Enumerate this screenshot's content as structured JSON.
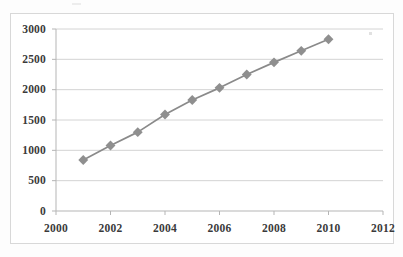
{
  "chart_data": {
    "type": "line",
    "title": "",
    "subtitle": "",
    "xlabel": "",
    "ylabel": "",
    "x": [
      2001,
      2002,
      2003,
      2004,
      2005,
      2006,
      2007,
      2008,
      2009,
      2010
    ],
    "values": [
      840,
      1080,
      1300,
      1590,
      1830,
      2030,
      2250,
      2450,
      2640,
      2830
    ],
    "series": [
      {
        "name": "",
        "x": [
          2001,
          2002,
          2003,
          2004,
          2005,
          2006,
          2007,
          2008,
          2009,
          2010
        ],
        "values": [
          840,
          1080,
          1300,
          1590,
          1830,
          2030,
          2250,
          2450,
          2640,
          2830
        ]
      }
    ],
    "xlim": [
      2000,
      2012
    ],
    "ylim": [
      0,
      3000
    ],
    "xticks": [
      2000,
      2002,
      2004,
      2006,
      2008,
      2010,
      2012
    ],
    "yticks": [
      0,
      500,
      1000,
      1500,
      2000,
      2500,
      3000
    ],
    "xtick_labels": [
      "2000",
      "2002",
      "2004",
      "2006",
      "2008",
      "2010",
      "2012"
    ],
    "ytick_labels": [
      "0",
      "500",
      "1000",
      "1500",
      "2000",
      "2500",
      "3000"
    ],
    "grid": "horizontal",
    "legend": "none",
    "annotations": [],
    "line_color": "#8a8a8a",
    "marker_color": "#8f8f8f",
    "marker_shape": "diamond",
    "gridline_color": "#cfcfcf",
    "axis_color": "#b5b5b5",
    "plot_background": "#ffffff",
    "figure_background": "#fdfdfd",
    "tick_label_color": "#3a3a3a"
  }
}
